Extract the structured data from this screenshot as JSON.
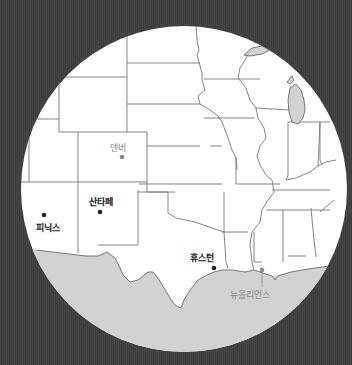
{
  "map": {
    "type": "circular-inset-map",
    "region": "South-central United States",
    "colors": {
      "background": "#3f3f3f",
      "land": "#ffffff",
      "water": "#d2d2d2",
      "borders": "#777777",
      "major_city": "#222222",
      "minor_city": "#888888"
    },
    "cities": [
      {
        "name": "덴버",
        "style": "minor"
      },
      {
        "name": "산타페",
        "style": "major"
      },
      {
        "name": "피닉스",
        "style": "major"
      },
      {
        "name": "휴스턴",
        "style": "major"
      },
      {
        "name": "뉴올리언스",
        "style": "minor"
      }
    ]
  }
}
